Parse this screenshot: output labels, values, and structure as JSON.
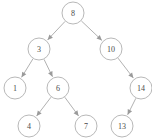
{
  "figure": {
    "kind": "binary-search-tree-diagram",
    "width": 152,
    "height": 138,
    "background_color": "#ffffff",
    "node_fill_color": "#ffffff",
    "node_stroke_color": "#b0b0b0",
    "edge_color": "#a8a8a8",
    "label_color": "#4a4a4a",
    "node_radius": 11
  },
  "nodes": [
    {
      "id": "n8",
      "label": "8",
      "x": 73,
      "y": 13,
      "depth": 0
    },
    {
      "id": "n3",
      "label": "3",
      "x": 39,
      "y": 49,
      "depth": 1
    },
    {
      "id": "n10",
      "label": "10",
      "x": 111,
      "y": 49,
      "depth": 1
    },
    {
      "id": "n1",
      "label": "1",
      "x": 15,
      "y": 88,
      "depth": 2
    },
    {
      "id": "n6",
      "label": "6",
      "x": 58,
      "y": 88,
      "depth": 2
    },
    {
      "id": "n14",
      "label": "14",
      "x": 141,
      "y": 88,
      "depth": 2
    },
    {
      "id": "n4",
      "label": "4",
      "x": 29,
      "y": 126,
      "depth": 3
    },
    {
      "id": "n7",
      "label": "7",
      "x": 86,
      "y": 126,
      "depth": 3
    },
    {
      "id": "n13",
      "label": "13",
      "x": 122,
      "y": 126,
      "depth": 3
    }
  ],
  "edges": [
    {
      "id": "e8-3",
      "from": "n8",
      "to": "n3",
      "side": "left",
      "arrow": true
    },
    {
      "id": "e8-10",
      "from": "n8",
      "to": "n10",
      "side": "right",
      "arrow": true
    },
    {
      "id": "e3-1",
      "from": "n3",
      "to": "n1",
      "side": "left",
      "arrow": true
    },
    {
      "id": "e3-6",
      "from": "n3",
      "to": "n6",
      "side": "right",
      "arrow": true
    },
    {
      "id": "e10-14",
      "from": "n10",
      "to": "n14",
      "side": "right",
      "arrow": true
    },
    {
      "id": "e6-4",
      "from": "n6",
      "to": "n4",
      "side": "left",
      "arrow": true
    },
    {
      "id": "e6-7",
      "from": "n6",
      "to": "n7",
      "side": "right",
      "arrow": true
    },
    {
      "id": "e14-13",
      "from": "n14",
      "to": "n13",
      "side": "left",
      "arrow": true
    }
  ]
}
